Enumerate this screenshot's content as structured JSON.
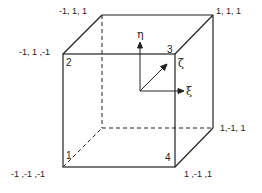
{
  "diagram": {
    "type": "hexahedral-element-natural-coordinates",
    "colors": {
      "line": "#222222",
      "background": "#ffffff"
    },
    "vertices": {
      "back_top_left": {
        "label": "-1, 1, 1"
      },
      "back_top_right": {
        "label": "1, 1, 1"
      },
      "front_top_left": {
        "label": "-1, 1 ,-1",
        "node": "2"
      },
      "front_top_right": {
        "node": "3"
      },
      "back_bottom_right": {
        "label": "1,-1, 1"
      },
      "front_bottom_left": {
        "label": "-1 ,-1 ,-1",
        "node": "1"
      },
      "front_bottom_right": {
        "label": "1 ,-1 ,1",
        "node": "4"
      }
    },
    "axes": {
      "eta": "η",
      "xi": "ξ",
      "zeta": "ζ"
    }
  }
}
